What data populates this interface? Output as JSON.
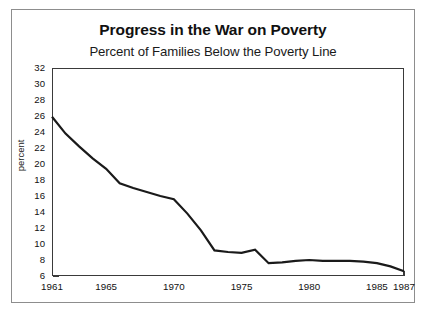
{
  "chart_data": {
    "type": "line",
    "title": "Progress in the War on Poverty",
    "subtitle": "Percent of Families Below the Poverty Line",
    "xlabel": "",
    "ylabel": "percent",
    "xlim": [
      1961,
      1987
    ],
    "ylim": [
      6,
      32
    ],
    "ytick_step": 2,
    "yticks": [
      6,
      8,
      10,
      12,
      14,
      16,
      18,
      20,
      22,
      24,
      26,
      28,
      30,
      32
    ],
    "ytick_labels": [
      "6",
      "8",
      "10",
      "12",
      "14",
      "16",
      "18",
      "20",
      "22",
      "24",
      "26",
      "28",
      "30",
      "32"
    ],
    "xticks": [
      1961,
      1962,
      1963,
      1964,
      1965,
      1966,
      1967,
      1968,
      1969,
      1970,
      1971,
      1972,
      1973,
      1974,
      1975,
      1976,
      1977,
      1978,
      1979,
      1980,
      1981,
      1982,
      1983,
      1984,
      1985,
      1986,
      1987
    ],
    "xtick_labels": [
      {
        "x": 1961,
        "label": "1961"
      },
      {
        "x": 1965,
        "label": "1965"
      },
      {
        "x": 1970,
        "label": "1970"
      },
      {
        "x": 1975,
        "label": "1975"
      },
      {
        "x": 1980,
        "label": "1980"
      },
      {
        "x": 1985,
        "label": "1985"
      },
      {
        "x": 1987,
        "label": "1987"
      }
    ],
    "grid": false,
    "legend": false,
    "series": [
      {
        "name": "Percent of families below the poverty line",
        "color": "#1a1a1a",
        "x": [
          1961,
          1962,
          1963,
          1964,
          1965,
          1966,
          1967,
          1968,
          1969,
          1970,
          1971,
          1972,
          1973,
          1974,
          1975,
          1976,
          1977,
          1978,
          1979,
          1980,
          1981,
          1982,
          1983,
          1984,
          1985,
          1986,
          1987
        ],
        "values": [
          25.9,
          23.8,
          22.2,
          20.7,
          19.4,
          17.6,
          17.0,
          16.5,
          16.0,
          15.6,
          13.8,
          11.7,
          9.2,
          9.0,
          8.9,
          9.3,
          7.6,
          7.7,
          7.9,
          8.0,
          7.9,
          7.9,
          7.9,
          7.8,
          7.6,
          7.2,
          6.6
        ]
      }
    ]
  }
}
